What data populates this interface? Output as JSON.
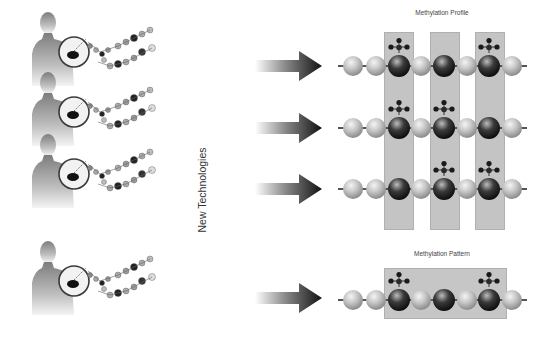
{
  "diagram": {
    "profile_title": "Methylation Profile",
    "pattern_title": "Methylation Pattern",
    "center_label": "New Technologies",
    "colors": {
      "column_fill": "#c4c4c4",
      "unmethylated_bead": "#a8a8a8",
      "cpg_bead": "#111111",
      "arrow_dark": "#1a1a1a",
      "figure": "#8c8c8c"
    },
    "samples": [
      {
        "id": 1,
        "icon": "person-with-dna-icon"
      },
      {
        "id": 2,
        "icon": "person-with-dna-icon"
      },
      {
        "id": 3,
        "icon": "person-with-dna-icon"
      },
      {
        "id": 4,
        "icon": "person-with-dna-icon"
      }
    ],
    "profile_rows": [
      {
        "beads": [
          "light",
          "light",
          "dark",
          "light",
          "dark",
          "light",
          "dark",
          "light"
        ],
        "methylated": [
          2,
          6
        ]
      },
      {
        "beads": [
          "light",
          "light",
          "dark",
          "light",
          "dark",
          "light",
          "dark",
          "light"
        ],
        "methylated": [
          2,
          4
        ]
      },
      {
        "beads": [
          "light",
          "light",
          "dark",
          "light",
          "dark",
          "light",
          "dark",
          "light"
        ],
        "methylated": [
          4,
          6
        ]
      }
    ],
    "pattern_row": {
      "beads": [
        "light",
        "light",
        "dark",
        "light",
        "dark",
        "light",
        "dark",
        "light"
      ],
      "methylated": [
        2,
        6
      ]
    }
  }
}
